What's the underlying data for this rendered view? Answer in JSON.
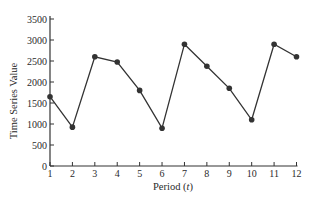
{
  "chart_data": {
    "type": "line",
    "title": "",
    "xlabel": "Period (t)",
    "xlabel_main": "Period (",
    "xlabel_var": "t",
    "xlabel_close": ")",
    "ylabel": "Time Series Value",
    "x": [
      1,
      2,
      3,
      4,
      5,
      6,
      7,
      8,
      9,
      10,
      11,
      12
    ],
    "values": [
      1650,
      925,
      2600,
      2475,
      1800,
      900,
      2900,
      2375,
      1850,
      1100,
      2900,
      2600
    ],
    "series": [
      {
        "name": "Time Series Value",
        "values": [
          1650,
          925,
          2600,
          2475,
          1800,
          900,
          2900,
          2375,
          1850,
          1100,
          2900,
          2600
        ]
      }
    ],
    "xticks": [
      "1",
      "2",
      "3",
      "4",
      "5",
      "6",
      "7",
      "8",
      "9",
      "10",
      "11",
      "12"
    ],
    "yticks": [
      "0",
      "500",
      "1000",
      "1500",
      "2000",
      "2500",
      "3000",
      "3500"
    ],
    "ylim": [
      0,
      3500
    ],
    "xlim": [
      1,
      12
    ],
    "grid": false,
    "legend": null,
    "markers": true,
    "line_color": "#333333",
    "marker_color": "#333333"
  }
}
